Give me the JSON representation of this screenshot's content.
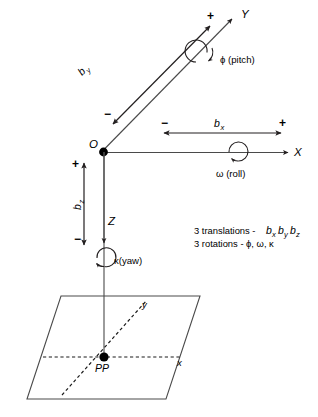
{
  "diagram": {
    "origin_label": "O",
    "principal_point_label": "PP",
    "axes": [
      {
        "name": "X",
        "label": "X"
      },
      {
        "name": "Y",
        "label": "Y"
      },
      {
        "name": "Z",
        "label": "Z"
      },
      {
        "name": "image-x",
        "label": "x"
      },
      {
        "name": "image-y",
        "label": "y"
      },
      {
        "name": "camera-x",
        "label": "+"
      }
    ],
    "translations": [
      {
        "name": "bx",
        "label": "b",
        "subscript": "x",
        "plus": "+",
        "minus": "−"
      },
      {
        "name": "by",
        "label": "b",
        "subscript": "y",
        "plus": "+",
        "minus": "−"
      },
      {
        "name": "bz",
        "label": "b",
        "subscript": "z",
        "plus": "+",
        "minus": "−"
      }
    ],
    "rotations": [
      {
        "name": "pitch",
        "label": "ϕ (pitch)",
        "axis": "Y"
      },
      {
        "name": "roll",
        "label": "ω (roll)",
        "axis": "X"
      },
      {
        "name": "yaw",
        "label": "κ(yaw)",
        "axis": "Z"
      }
    ],
    "legend": {
      "translations_prefix": "3 translations - ",
      "translations_terms": "b",
      "rotations_line": "3 rotations - ϕ, ω, κ"
    },
    "colors": {
      "ink": "#000000",
      "line": "#231f20",
      "axis": "#4a4a4a",
      "background": "#ffffff"
    }
  }
}
